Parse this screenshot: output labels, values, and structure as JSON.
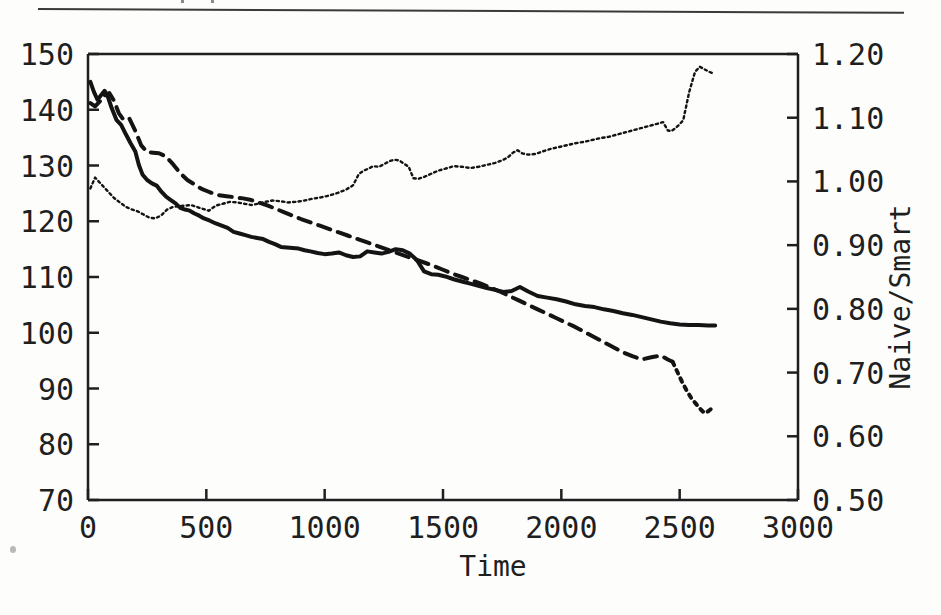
{
  "figure": {
    "top_rule": true,
    "artifact_dot": true
  },
  "chart_data": {
    "type": "line",
    "title": "",
    "xlabel": "Time",
    "ylabel": "",
    "ylabel_right": "Naive/Smart",
    "xlim": [
      0,
      3000
    ],
    "ylim": [
      70,
      150
    ],
    "ylim_right": [
      0.5,
      1.2
    ],
    "grid": false,
    "legend": "none",
    "xticks": [
      0,
      500,
      1000,
      1500,
      2000,
      2500,
      3000
    ],
    "xticklabels": [
      "0",
      "500",
      "1000",
      "1500",
      "2000",
      "2500",
      "3000"
    ],
    "yticks": [
      70,
      80,
      90,
      100,
      110,
      120,
      130,
      140,
      150
    ],
    "yticklabels": [
      "70",
      "80",
      "90",
      "100",
      "110",
      "120",
      "130",
      "140",
      "150"
    ],
    "yticks_right": [
      0.5,
      0.6,
      0.7,
      0.8,
      0.9,
      1.0,
      1.1,
      1.2
    ],
    "yticklabels_right": [
      "0.50",
      "0.60",
      "0.70",
      "0.80",
      "0.90",
      "1.00",
      "1.10",
      "1.20"
    ],
    "series": [
      {
        "name": "solid-curve",
        "axis": "left",
        "style": "solid",
        "color": "#141414",
        "width": 4,
        "x": [
          10,
          25,
          40,
          55,
          70,
          85,
          100,
          120,
          140,
          160,
          180,
          200,
          215,
          230,
          250,
          270,
          290,
          310,
          330,
          350,
          370,
          390,
          410,
          430,
          450,
          470,
          490,
          515,
          540,
          565,
          590,
          615,
          640,
          665,
          690,
          715,
          740,
          765,
          790,
          815,
          840,
          865,
          890,
          915,
          940,
          970,
          1000,
          1030,
          1060,
          1090,
          1120,
          1150,
          1180,
          1210,
          1240,
          1270,
          1300,
          1330,
          1360,
          1390,
          1420,
          1450,
          1480,
          1510,
          1545,
          1580,
          1615,
          1650,
          1685,
          1720,
          1755,
          1790,
          1825,
          1860,
          1900,
          1940,
          1980,
          2020,
          2060,
          2100,
          2140,
          2180,
          2220,
          2260,
          2300,
          2340,
          2380,
          2420,
          2460,
          2500,
          2540,
          2580,
          2620,
          2650
        ],
        "y": [
          145.0,
          143.2,
          141.8,
          142.6,
          143.4,
          142.2,
          140.3,
          138.2,
          137.3,
          135.6,
          134.0,
          132.5,
          130.1,
          128.4,
          127.4,
          126.8,
          126.4,
          125.3,
          124.4,
          123.8,
          123.2,
          122.4,
          122.1,
          121.9,
          121.4,
          121.0,
          120.5,
          120.1,
          119.6,
          119.2,
          118.8,
          118.1,
          117.8,
          117.5,
          117.2,
          117.0,
          116.8,
          116.3,
          115.9,
          115.4,
          115.3,
          115.2,
          115.1,
          114.8,
          114.6,
          114.3,
          114.1,
          114.2,
          114.4,
          113.9,
          113.6,
          113.7,
          114.6,
          114.4,
          114.2,
          114.5,
          115.0,
          114.8,
          114.2,
          113.0,
          111.0,
          110.5,
          110.4,
          110.1,
          109.6,
          109.2,
          108.8,
          108.4,
          108.0,
          107.7,
          107.3,
          107.5,
          108.2,
          107.4,
          106.6,
          106.3,
          106.0,
          105.6,
          105.1,
          104.8,
          104.6,
          104.2,
          103.9,
          103.5,
          103.2,
          102.8,
          102.4,
          102.0,
          101.7,
          101.5,
          101.4,
          101.4,
          101.3,
          101.3
        ]
      },
      {
        "name": "dashed-curve",
        "axis": "left",
        "style": "dashed",
        "color": "#141414",
        "width": 4,
        "x": [
          10,
          30,
          50,
          70,
          90,
          110,
          130,
          150,
          175,
          200,
          225,
          250,
          275,
          300,
          330,
          360,
          390,
          420,
          450,
          480,
          515,
          550,
          585,
          620,
          655,
          690,
          725,
          760,
          795,
          830,
          865,
          900,
          940,
          980,
          1020,
          1060,
          1100,
          1140,
          1180,
          1220,
          1260,
          1300,
          1340,
          1380,
          1420,
          1460,
          1500,
          1540,
          1580,
          1620,
          1660,
          1700,
          1740,
          1780,
          1820,
          1860,
          1900,
          1940,
          1980,
          2020,
          2060,
          2100,
          2140,
          2180,
          2220,
          2260,
          2300,
          2340,
          2380,
          2420,
          2450,
          2470
        ],
        "y": [
          141.2,
          140.6,
          141.5,
          142.6,
          143.0,
          141.6,
          139.4,
          138.2,
          138.4,
          136.2,
          133.6,
          132.4,
          132.3,
          132.2,
          131.6,
          130.2,
          128.6,
          127.4,
          126.6,
          125.8,
          125.2,
          124.7,
          124.5,
          124.3,
          124.1,
          123.8,
          123.3,
          122.8,
          122.2,
          121.6,
          121.0,
          120.4,
          119.8,
          119.2,
          118.6,
          118.0,
          117.4,
          116.8,
          116.2,
          115.6,
          115.0,
          114.4,
          113.8,
          113.2,
          112.6,
          112.0,
          111.3,
          110.6,
          110.0,
          109.4,
          108.8,
          108.1,
          107.4,
          106.6,
          105.8,
          105.0,
          104.2,
          103.4,
          102.6,
          101.8,
          101.0,
          100.1,
          99.2,
          98.3,
          97.4,
          96.5,
          95.8,
          95.2,
          95.6,
          95.9,
          95.2,
          94.8
        ]
      },
      {
        "name": "dashed-curve-tail-dotted",
        "axis": "left",
        "style": "dotted",
        "color": "#141414",
        "width": 4,
        "x": [
          2470,
          2490,
          2510,
          2530,
          2550,
          2570,
          2590,
          2605,
          2620,
          2635,
          2645
        ],
        "y": [
          94.8,
          93.0,
          91.2,
          89.6,
          88.2,
          87.2,
          86.2,
          85.6,
          85.9,
          86.4,
          86.5
        ]
      },
      {
        "name": "dotted-ratio-curve",
        "axis": "right",
        "style": "dotted",
        "color": "#141414",
        "width": 2.4,
        "x": [
          10,
          30,
          50,
          70,
          90,
          110,
          135,
          160,
          185,
          210,
          235,
          260,
          285,
          310,
          335,
          360,
          385,
          410,
          435,
          460,
          485,
          510,
          540,
          570,
          600,
          630,
          660,
          690,
          720,
          750,
          780,
          810,
          845,
          880,
          915,
          950,
          985,
          1020,
          1055,
          1090,
          1120,
          1145,
          1165,
          1185,
          1205,
          1230,
          1255,
          1275,
          1295,
          1315,
          1335,
          1355,
          1375,
          1395,
          1420,
          1450,
          1480,
          1510,
          1545,
          1580,
          1615,
          1650,
          1685,
          1720,
          1750,
          1775,
          1795,
          1815,
          1835,
          1860,
          1890,
          1920,
          1955,
          1990,
          2025,
          2060,
          2095,
          2130,
          2165,
          2200,
          2240,
          2280,
          2320,
          2360,
          2400,
          2430,
          2450,
          2465,
          2480,
          2495,
          2515,
          2540,
          2565,
          2585,
          2605,
          2625,
          2645
        ],
        "y": [
          0.989,
          1.006,
          0.998,
          0.99,
          0.982,
          0.974,
          0.967,
          0.96,
          0.956,
          0.953,
          0.948,
          0.943,
          0.942,
          0.947,
          0.956,
          0.96,
          0.961,
          0.962,
          0.963,
          0.96,
          0.957,
          0.954,
          0.962,
          0.965,
          0.968,
          0.967,
          0.965,
          0.963,
          0.965,
          0.968,
          0.97,
          0.969,
          0.967,
          0.968,
          0.97,
          0.973,
          0.975,
          0.978,
          0.982,
          0.987,
          0.994,
          1.012,
          1.017,
          1.02,
          1.024,
          1.023,
          1.028,
          1.032,
          1.034,
          1.033,
          1.028,
          1.023,
          1.005,
          1.004,
          1.007,
          1.012,
          1.017,
          1.02,
          1.024,
          1.023,
          1.021,
          1.023,
          1.026,
          1.029,
          1.033,
          1.038,
          1.045,
          1.049,
          1.044,
          1.042,
          1.043,
          1.047,
          1.051,
          1.054,
          1.057,
          1.06,
          1.062,
          1.065,
          1.068,
          1.07,
          1.074,
          1.078,
          1.082,
          1.086,
          1.09,
          1.093,
          1.08,
          1.079,
          1.083,
          1.088,
          1.096,
          1.14,
          1.172,
          1.18,
          1.176,
          1.172,
          1.169
        ]
      }
    ]
  }
}
